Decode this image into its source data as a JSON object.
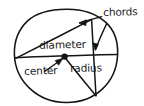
{
  "diagram": {
    "background_color": "#ffffff",
    "stroke_color": "#141414",
    "labels": {
      "chords": "chords",
      "diameter": "diameter",
      "center": "center",
      "radius": "radius"
    },
    "geometry": {
      "circle": {
        "cx": 66,
        "cy": 57,
        "rx": 51,
        "ry": 48
      },
      "center_dot": {
        "x": 64.5,
        "y": 56.5,
        "r": 3.1
      },
      "diameter_line": {
        "x1": 14.5,
        "y1": 57.5,
        "x2": 117,
        "y2": 54.5
      },
      "radius_line": {
        "x1": 64.5,
        "y1": 56.5,
        "x2": 96,
        "y2": 96
      },
      "chord_upper": {
        "x1": 16,
        "y1": 58,
        "x2": 91,
        "y2": 19
      },
      "chord_lower": {
        "x1": 91,
        "y1": 19,
        "x2": 96,
        "y2": 96
      },
      "arrow_to_chord_upper": {
        "x1": 101,
        "y1": 17,
        "x2": 79,
        "y2": 23
      },
      "arrow_to_chord_lower": {
        "x1": 107,
        "y1": 24,
        "x2": 95,
        "y2": 50
      },
      "arrow_to_center": {
        "x1": 45,
        "y1": 71,
        "x2": 62,
        "y2": 59
      }
    }
  }
}
